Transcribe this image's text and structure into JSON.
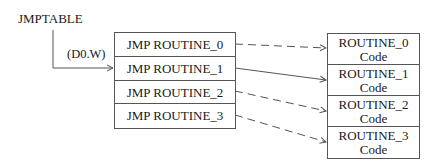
{
  "diagram": {
    "title": "JMPTABLE",
    "offset_label": "(D0.W)",
    "jump_table": {
      "entries": [
        "JMP ROUTINE_0",
        "JMP ROUTINE_1",
        "JMP ROUTINE_2",
        "JMP ROUTINE_3"
      ]
    },
    "routines": [
      {
        "name": "ROUTINE_0",
        "sub": "Code"
      },
      {
        "name": "ROUTINE_1",
        "sub": "Code"
      },
      {
        "name": "ROUTINE_2",
        "sub": "Code"
      },
      {
        "name": "ROUTINE_3",
        "sub": "Code"
      }
    ],
    "connections": [
      {
        "from": "JMP ROUTINE_0",
        "to": "ROUTINE_0",
        "style": "dashed"
      },
      {
        "from": "JMP ROUTINE_1",
        "to": "ROUTINE_1",
        "style": "solid"
      },
      {
        "from": "JMP ROUTINE_2",
        "to": "ROUTINE_2",
        "style": "dashed"
      },
      {
        "from": "JMP ROUTINE_3",
        "to": "ROUTINE_3",
        "style": "dashed"
      }
    ],
    "colors": {
      "line": "#555555",
      "text": "#1a1a1a",
      "background": "#ffffff"
    }
  }
}
